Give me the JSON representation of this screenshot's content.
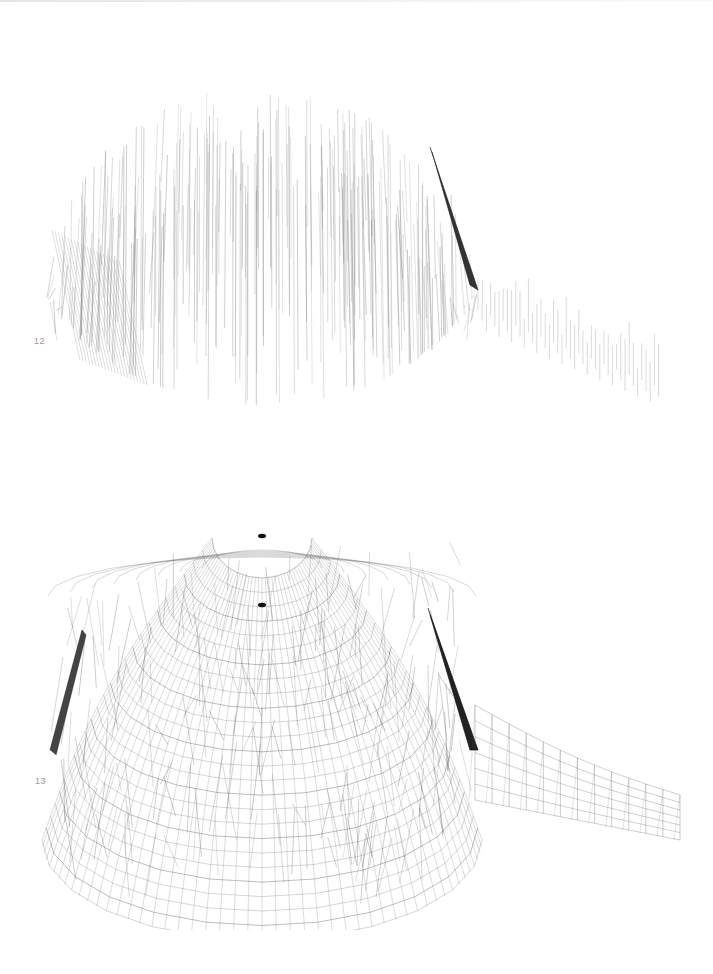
{
  "page": {
    "background": "#ffffff"
  },
  "figures": [
    {
      "id": "12",
      "label": "12",
      "description": "Vertical-member projection of domed structure with attached curved wing",
      "style": "vertical-lines",
      "stroke_color": "#8c8c8c",
      "accent_color": "#222222"
    },
    {
      "id": "13",
      "label": "13",
      "description": "Full wireframe lattice of domed polygonal structure with attached curved wing",
      "style": "lattice",
      "stroke_color": "#555555",
      "accent_color": "#111111"
    }
  ]
}
